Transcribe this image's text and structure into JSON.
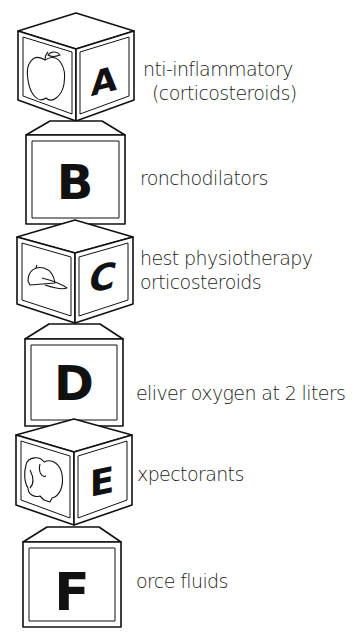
{
  "mnemonic": {
    "blocks": [
      {
        "letter": "A",
        "style": "cube",
        "picture": "apple",
        "lines": [
          "nti-inflammatory",
          "(corticosteroids)"
        ]
      },
      {
        "letter": "B",
        "style": "front",
        "picture": null,
        "lines": [
          "ronchodilators"
        ]
      },
      {
        "letter": "C",
        "style": "cube",
        "picture": "baseball-cap",
        "lines": [
          "hest physiotherapy",
          "orticosteroids"
        ]
      },
      {
        "letter": "D",
        "style": "front",
        "picture": null,
        "lines": [
          "eliver oxygen at 2 liters"
        ]
      },
      {
        "letter": "E",
        "style": "cube",
        "picture": "elephant",
        "lines": [
          "xpectorants"
        ]
      },
      {
        "letter": "F",
        "style": "front",
        "picture": null,
        "lines": [
          "orce fluids"
        ]
      }
    ]
  },
  "colors": {
    "ink": "#111111",
    "background": "#ffffff"
  }
}
